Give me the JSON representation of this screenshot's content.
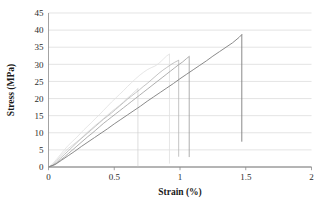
{
  "chart_data": {
    "type": "line",
    "title": "",
    "subtitle": "",
    "xlabel": "Strain (%)",
    "ylabel": "Stress (MPa)",
    "xlim": [
      0,
      2
    ],
    "ylim": [
      0,
      45
    ],
    "xticks": [
      "0",
      "0.5",
      "1",
      "1.5",
      "2"
    ],
    "xtick_values": [
      0,
      0.5,
      1,
      1.5,
      2
    ],
    "yticks": [
      "0",
      "5",
      "10",
      "15",
      "20",
      "25",
      "30",
      "35",
      "40",
      "45"
    ],
    "ytick_values": [
      0,
      5,
      10,
      15,
      20,
      25,
      30,
      35,
      40,
      45
    ],
    "grid": "horizontal",
    "gridlines_horizontal": true,
    "gridlines_vertical": false,
    "legend": "none",
    "legend_position": "none",
    "annotations": [],
    "grid_color": "#d9d9d9",
    "axis_color": "#8c8c8c",
    "background": "#ffffff",
    "series": [
      {
        "name": "Specimen 1",
        "color": "#cfcfcf",
        "width": 0.7,
        "peak": {
          "x": 0.68,
          "y": 22.9
        },
        "fail_drop_to": 0.2,
        "points": [
          [
            0.0,
            0.0
          ],
          [
            0.03,
            0.6
          ],
          [
            0.06,
            1.8
          ],
          [
            0.09,
            3.1
          ],
          [
            0.12,
            4.3
          ],
          [
            0.15,
            5.4
          ],
          [
            0.18,
            6.3
          ],
          [
            0.21,
            7.2
          ],
          [
            0.24,
            8.1
          ],
          [
            0.27,
            9.2
          ],
          [
            0.3,
            10.3
          ],
          [
            0.33,
            11.3
          ],
          [
            0.36,
            12.3
          ],
          [
            0.39,
            13.2
          ],
          [
            0.42,
            14.2
          ],
          [
            0.45,
            15.2
          ],
          [
            0.48,
            16.2
          ],
          [
            0.51,
            17.1
          ],
          [
            0.54,
            18.0
          ],
          [
            0.57,
            19.0
          ],
          [
            0.6,
            20.1
          ],
          [
            0.63,
            21.1
          ],
          [
            0.66,
            22.2
          ],
          [
            0.68,
            22.9
          ]
        ]
      },
      {
        "name": "Specimen 2",
        "color": "#e0e0e0",
        "width": 0.8,
        "peak": {
          "x": 0.92,
          "y": 33.0
        },
        "fail_drop_to": 1.0,
        "points": [
          [
            0.0,
            0.0
          ],
          [
            0.03,
            0.9
          ],
          [
            0.06,
            2.2
          ],
          [
            0.09,
            3.6
          ],
          [
            0.12,
            5.0
          ],
          [
            0.15,
            6.3
          ],
          [
            0.18,
            7.4
          ],
          [
            0.21,
            8.5
          ],
          [
            0.24,
            9.7
          ],
          [
            0.27,
            10.9
          ],
          [
            0.3,
            12.0
          ],
          [
            0.33,
            13.1
          ],
          [
            0.36,
            14.3
          ],
          [
            0.39,
            15.4
          ],
          [
            0.42,
            16.6
          ],
          [
            0.45,
            17.8
          ],
          [
            0.48,
            19.0
          ],
          [
            0.51,
            20.1
          ],
          [
            0.54,
            21.2
          ],
          [
            0.57,
            22.3
          ],
          [
            0.6,
            23.5
          ],
          [
            0.63,
            24.6
          ],
          [
            0.66,
            25.7
          ],
          [
            0.69,
            26.7
          ],
          [
            0.72,
            27.6
          ],
          [
            0.75,
            28.4
          ],
          [
            0.78,
            29.0
          ],
          [
            0.81,
            29.5
          ],
          [
            0.84,
            30.3
          ],
          [
            0.87,
            31.4
          ],
          [
            0.9,
            32.5
          ],
          [
            0.92,
            33.0
          ]
        ]
      },
      {
        "name": "Specimen 3",
        "color": "#b5b5b5",
        "width": 0.8,
        "peak": {
          "x": 0.99,
          "y": 31.2
        },
        "fail_drop_to": 3.0,
        "points": [
          [
            0.0,
            0.0
          ],
          [
            0.03,
            0.5
          ],
          [
            0.06,
            1.4
          ],
          [
            0.09,
            2.5
          ],
          [
            0.12,
            3.6
          ],
          [
            0.15,
            4.7
          ],
          [
            0.18,
            5.8
          ],
          [
            0.21,
            6.9
          ],
          [
            0.24,
            8.0
          ],
          [
            0.27,
            9.0
          ],
          [
            0.3,
            10.0
          ],
          [
            0.33,
            11.0
          ],
          [
            0.36,
            12.0
          ],
          [
            0.39,
            13.0
          ],
          [
            0.42,
            14.0
          ],
          [
            0.45,
            14.9
          ],
          [
            0.48,
            15.8
          ],
          [
            0.51,
            16.8
          ],
          [
            0.54,
            17.8
          ],
          [
            0.57,
            18.8
          ],
          [
            0.6,
            19.8
          ],
          [
            0.63,
            20.7
          ],
          [
            0.66,
            21.6
          ],
          [
            0.69,
            22.5
          ],
          [
            0.72,
            23.5
          ],
          [
            0.75,
            24.4
          ],
          [
            0.78,
            25.4
          ],
          [
            0.81,
            26.4
          ],
          [
            0.84,
            27.4
          ],
          [
            0.87,
            28.3
          ],
          [
            0.9,
            29.1
          ],
          [
            0.93,
            29.9
          ],
          [
            0.96,
            30.6
          ],
          [
            0.99,
            31.2
          ]
        ]
      },
      {
        "name": "Specimen 4",
        "color": "#9a9a9a",
        "width": 0.8,
        "peak": {
          "x": 1.07,
          "y": 32.3
        },
        "fail_drop_to": 2.9,
        "points": [
          [
            0.0,
            0.0
          ],
          [
            0.03,
            0.4
          ],
          [
            0.06,
            1.1
          ],
          [
            0.09,
            2.0
          ],
          [
            0.12,
            2.9
          ],
          [
            0.15,
            3.9
          ],
          [
            0.18,
            4.9
          ],
          [
            0.21,
            5.9
          ],
          [
            0.24,
            6.9
          ],
          [
            0.27,
            7.9
          ],
          [
            0.3,
            8.9
          ],
          [
            0.33,
            9.8
          ],
          [
            0.36,
            10.8
          ],
          [
            0.39,
            11.8
          ],
          [
            0.42,
            12.8
          ],
          [
            0.45,
            13.7
          ],
          [
            0.48,
            14.6
          ],
          [
            0.51,
            15.5
          ],
          [
            0.54,
            16.4
          ],
          [
            0.57,
            17.3
          ],
          [
            0.6,
            18.2
          ],
          [
            0.63,
            19.1
          ],
          [
            0.66,
            20.0
          ],
          [
            0.69,
            20.9
          ],
          [
            0.72,
            21.8
          ],
          [
            0.75,
            22.7
          ],
          [
            0.78,
            23.6
          ],
          [
            0.81,
            24.5
          ],
          [
            0.84,
            25.4
          ],
          [
            0.87,
            26.3
          ],
          [
            0.9,
            27.2
          ],
          [
            0.93,
            28.1
          ],
          [
            0.96,
            29.0
          ],
          [
            0.99,
            29.9
          ],
          [
            1.02,
            30.7
          ],
          [
            1.05,
            31.7
          ],
          [
            1.07,
            32.3
          ]
        ]
      },
      {
        "name": "Specimen 5",
        "color": "#7d7d7d",
        "width": 0.9,
        "peak": {
          "x": 1.47,
          "y": 38.7
        },
        "fail_drop_to": 7.4,
        "points": [
          [
            0.0,
            0.0
          ],
          [
            0.05,
            0.7
          ],
          [
            0.1,
            2.0
          ],
          [
            0.15,
            3.3
          ],
          [
            0.2,
            4.6
          ],
          [
            0.25,
            6.0
          ],
          [
            0.3,
            7.3
          ],
          [
            0.35,
            8.6
          ],
          [
            0.4,
            9.9
          ],
          [
            0.45,
            11.2
          ],
          [
            0.5,
            12.6
          ],
          [
            0.55,
            13.9
          ],
          [
            0.6,
            15.2
          ],
          [
            0.65,
            16.5
          ],
          [
            0.7,
            17.8
          ],
          [
            0.75,
            19.2
          ],
          [
            0.8,
            20.5
          ],
          [
            0.85,
            21.8
          ],
          [
            0.9,
            23.1
          ],
          [
            0.95,
            24.4
          ],
          [
            1.0,
            25.8
          ],
          [
            1.05,
            27.1
          ],
          [
            1.1,
            28.4
          ],
          [
            1.15,
            29.7
          ],
          [
            1.2,
            31.0
          ],
          [
            1.25,
            32.4
          ],
          [
            1.3,
            33.7
          ],
          [
            1.35,
            35.0
          ],
          [
            1.4,
            36.3
          ],
          [
            1.45,
            37.9
          ],
          [
            1.47,
            38.7
          ]
        ]
      }
    ]
  }
}
